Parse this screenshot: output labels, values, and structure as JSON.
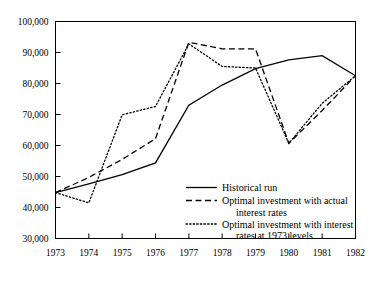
{
  "chart_data": {
    "type": "line",
    "title": "",
    "subtitle": "",
    "xlabel": "",
    "ylabel": "",
    "grid": false,
    "legend_position": "inside-lower-right",
    "x": [
      1973,
      1974,
      1975,
      1976,
      1977,
      1978,
      1979,
      1980,
      1981,
      1982
    ],
    "categories": [
      "1973",
      "1974",
      "1975",
      "1976",
      "1977",
      "1978",
      "1979",
      "1980",
      "1981",
      "1982"
    ],
    "xlim": [
      1973,
      1982
    ],
    "ylim": [
      30000,
      100000
    ],
    "ytick_labels": [
      "100,000",
      "90,000",
      "80,000",
      "70,000",
      "60,000",
      "50,000",
      "40,000",
      "30,000"
    ],
    "ytick_values": [
      100000,
      90000,
      80000,
      70000,
      60000,
      50000,
      40000,
      30000
    ],
    "xtick_labels": [
      "1973",
      "1974",
      "1975",
      "1976",
      "1977",
      "1978",
      "1979",
      "1980",
      "1981",
      "1982"
    ],
    "series": [
      {
        "name": "Historical run",
        "style": "solid",
        "values": [
          44800,
          47600,
          50600,
          54400,
          73000,
          79500,
          84800,
          87600,
          89000,
          82500
        ]
      },
      {
        "name": "Optimal investment with actual interest rates",
        "style": "dashed",
        "values": [
          44800,
          49700,
          55500,
          62200,
          93300,
          91200,
          91200,
          60700,
          71300,
          82500
        ]
      },
      {
        "name": "Optimal investment with interest rates at 1973 levels",
        "style": "dotted",
        "values": [
          44800,
          41500,
          69900,
          72600,
          92800,
          85500,
          85000,
          60700,
          73600,
          82500
        ]
      }
    ]
  },
  "legend": {
    "entries": [
      {
        "label": "Historical run",
        "style": "solid"
      },
      {
        "label": "Optimal investment with actual",
        "label2": "interest rates",
        "style": "dashed"
      },
      {
        "label": "Optimal investment with interest",
        "label2": "rates at 1973 levels",
        "style": "dotted"
      }
    ]
  },
  "colors": {
    "line": "#000000",
    "axis": "#000000",
    "background": "#ffffff"
  }
}
